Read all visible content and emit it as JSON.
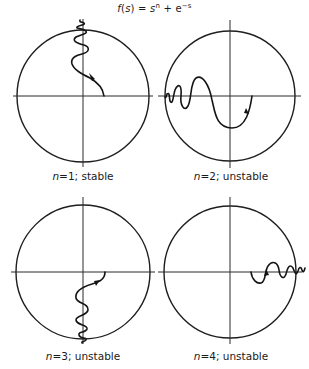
{
  "title": {
    "prefix": "f(s) = s",
    "exponent": "n",
    "middle": " + e",
    "exponent2": "−s"
  },
  "panels": [
    {
      "id": "panel-n1",
      "n_label": "n",
      "caption": "=1; stable",
      "n": 1,
      "stability": "stable",
      "center": [
        83,
        96
      ],
      "radius": 66
    },
    {
      "id": "panel-n2",
      "n_label": "n",
      "caption": "=2; unstable",
      "n": 2,
      "stability": "unstable",
      "center": [
        230,
        96
      ],
      "radius": 65
    },
    {
      "id": "panel-n3",
      "n_label": "n",
      "caption": "=3; unstable",
      "n": 3,
      "stability": "unstable",
      "center": [
        83,
        272
      ],
      "radius": 67
    },
    {
      "id": "panel-n4",
      "n_label": "n",
      "caption": "=4; unstable",
      "n": 4,
      "stability": "unstable",
      "center": [
        230,
        272
      ],
      "radius": 66
    }
  ],
  "colors": {
    "ink": "#141414",
    "background": "#ffffff"
  }
}
